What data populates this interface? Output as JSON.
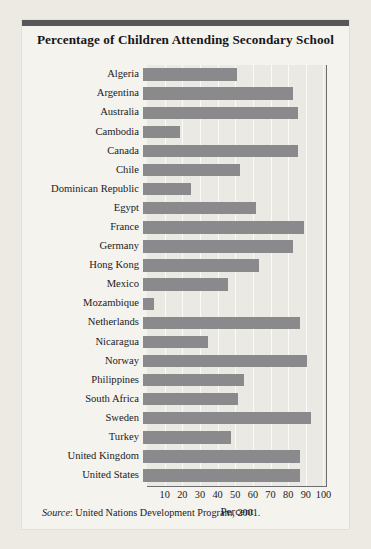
{
  "card": {
    "title": "Percentage of Children Attending Secondary School",
    "source_label": "Source",
    "source_separator": ": ",
    "source_text": "United Nations Development Program, 2001."
  },
  "colors": {
    "page_background": "#eceae3",
    "card_background": "#f4f3ee",
    "top_rule": "#58585a",
    "plot_background": "#ebe9e3",
    "bar": "#8a8a8c",
    "gridline": "#fbfaf7",
    "axis_line": "#6e6e70",
    "text": "#1b1a1d"
  },
  "chart_data": {
    "type": "bar",
    "orientation": "horizontal",
    "title": "Percentage of Children Attending Secondary School",
    "xlabel": "Percent",
    "ylabel": "",
    "xlim": [
      0,
      102
    ],
    "grid": true,
    "legend": null,
    "xticks": [
      10,
      20,
      30,
      40,
      50,
      60,
      70,
      80,
      90,
      100
    ],
    "xticklabels": [
      "10",
      "20",
      "30",
      "40",
      "50",
      "60",
      "70",
      "80",
      "90",
      "100"
    ],
    "categories": [
      "Algeria",
      "Argentina",
      "Australia",
      "Cambodia",
      "Canada",
      "Chile",
      "Dominican Republic",
      "Egypt",
      "France",
      "Germany",
      "Hong Kong",
      "Mexico",
      "Mozambique",
      "Netherlands",
      "Nicaragua",
      "Norway",
      "Philippines",
      "South Africa",
      "Sweden",
      "Turkey",
      "United Kingdom",
      "United States"
    ],
    "values": [
      53,
      85,
      88,
      21,
      88,
      55,
      27,
      64,
      91,
      85,
      66,
      48,
      6,
      89,
      37,
      93,
      57,
      54,
      95,
      50,
      89,
      89
    ],
    "annotation": "Source: United Nations Development Program, 2001."
  }
}
